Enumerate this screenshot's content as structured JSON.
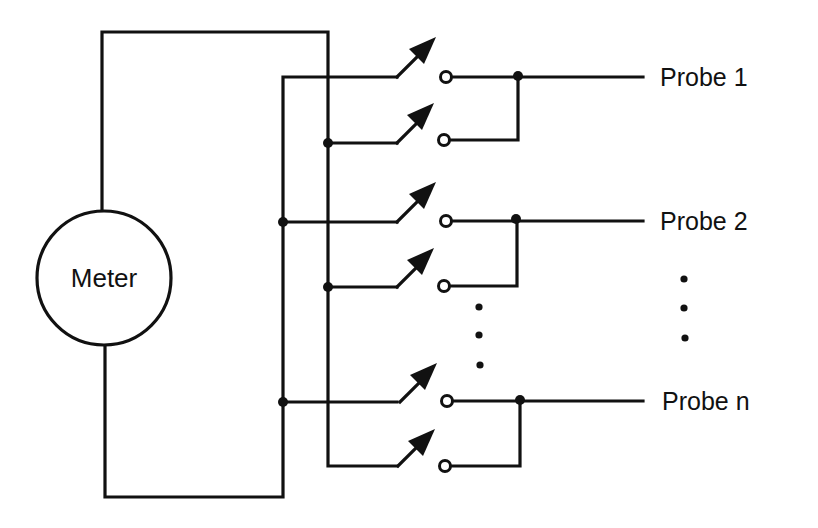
{
  "diagram": {
    "meter": {
      "label": "Meter",
      "cx": 104,
      "cy": 278,
      "r": 67
    },
    "probes": [
      {
        "label": "Probe 1",
        "y": 77
      },
      {
        "label": "Probe 2",
        "y": 222
      },
      {
        "label": "Probe n",
        "y": 402
      }
    ],
    "switch_rows_y": [
      77,
      143,
      222,
      287,
      402,
      466
    ],
    "ellipsis": {
      "between_switches": "⋮",
      "between_probes": "⋮"
    },
    "colors": {
      "line": "#111111",
      "background": "#ffffff"
    }
  }
}
